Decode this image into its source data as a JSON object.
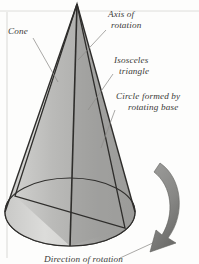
{
  "figure": {
    "background_color": "#fdfdfc",
    "ink_color": "#2e2d2b",
    "label_color": "#3b3a38"
  },
  "labels": {
    "cone": {
      "text": "Cone",
      "lines": [
        "Cone"
      ]
    },
    "axis_of_rotation": {
      "text": "Axis of rotation",
      "lines": [
        "Axis of",
        "rotation"
      ]
    },
    "isosceles_triangle": {
      "text": "Isosceles triangle",
      "lines": [
        "Isosceles",
        "triangle"
      ]
    },
    "circle_formed": {
      "text": "Circle formed by rotating base",
      "lines": [
        "Circle formed by",
        "rotating base"
      ]
    },
    "direction_of_rotation": {
      "text": "Direction of rotation",
      "lines": [
        "Direction of rotation"
      ]
    }
  },
  "shading": {
    "cone_left_face": "#d6d6d4",
    "cone_mid_face": "#bcbcba",
    "cone_right_face": "#a6a6a4",
    "cone_right_dark": "#9a9a98",
    "base_front": "#ededeb",
    "base_back": "#cfcfcd",
    "arrow_fill": "#8e8e8c",
    "arrow_dark": "#6f6f6d",
    "rule_color": "#c9c9c7"
  },
  "geometry": {
    "apex": {
      "x": 77,
      "y": 4
    },
    "base_center": {
      "x": 70,
      "y": 212
    },
    "base_radius_x": 66,
    "base_radius_y": 34,
    "axis_bottom": {
      "x": 70,
      "y": 246
    },
    "triangle_left_vertex": {
      "x": 15,
      "y": 196
    },
    "triangle_right_vertex": {
      "x": 125,
      "y": 228
    }
  },
  "page_rules": {
    "left_margin_x": 7,
    "top_rule_y": 11
  }
}
